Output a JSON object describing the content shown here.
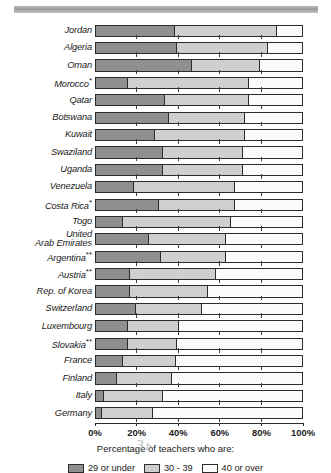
{
  "chart_data": {
    "type": "bar",
    "orientation": "horizontal",
    "stacked": true,
    "stacked_percent": true,
    "title": "",
    "xlabel": "Percentage of teachers who are:",
    "ylabel": "",
    "xlim": [
      0,
      100
    ],
    "grid": true,
    "legend_position": "bottom",
    "xtick_labels": [
      "0%",
      "20%",
      "40%",
      "60%",
      "80%",
      "100%"
    ],
    "xticks": [
      0,
      20,
      40,
      60,
      80,
      100
    ],
    "legend": [
      "29 or under",
      "30 - 39",
      "40 or over"
    ],
    "categories": [
      "Jordan",
      "Algeria",
      "Oman",
      "Morocco",
      "Qatar",
      "Botswana",
      "Kuwait",
      "Swaziland",
      "Uganda",
      "Venezuela",
      "Costa Rica",
      "Togo",
      "United\nArab Emirates",
      "Argentina",
      "Austria",
      "Rep. of Korea",
      "Switzerland",
      "Luxembourg",
      "Slovakia",
      "France",
      "Finland",
      "Italy",
      "Germany"
    ],
    "category_footnotes": [
      "",
      "",
      "",
      "*",
      "",
      "",
      "",
      "",
      "",
      "",
      "*",
      "",
      "",
      "**",
      "**",
      "",
      "",
      "",
      "**",
      "",
      "",
      "",
      ""
    ],
    "series": [
      {
        "name": "29 or under",
        "color": "#8f8f8f",
        "values": [
          38,
          39,
          46,
          15,
          33,
          35,
          28,
          32,
          32,
          18,
          30,
          12.5,
          25,
          31,
          16,
          16,
          19,
          15,
          15,
          12.5,
          9.5,
          3.5,
          2.5
        ]
      },
      {
        "name": "30 - 39",
        "color": "#cfcfcf",
        "values": [
          49.5,
          44,
          33,
          59,
          41,
          37,
          44,
          39,
          39,
          49,
          37,
          52.5,
          37.5,
          31.5,
          42,
          38,
          32,
          25,
          24,
          26,
          27,
          28.5,
          24.5
        ]
      },
      {
        "name": "40 or over",
        "color": "#fbfbfb",
        "values": [
          12.5,
          17,
          21,
          26,
          26,
          28,
          28,
          29,
          29,
          33,
          33,
          35,
          37.5,
          37.5,
          42,
          46,
          49,
          60,
          61,
          61.5,
          63.5,
          68,
          73
        ]
      }
    ]
  }
}
